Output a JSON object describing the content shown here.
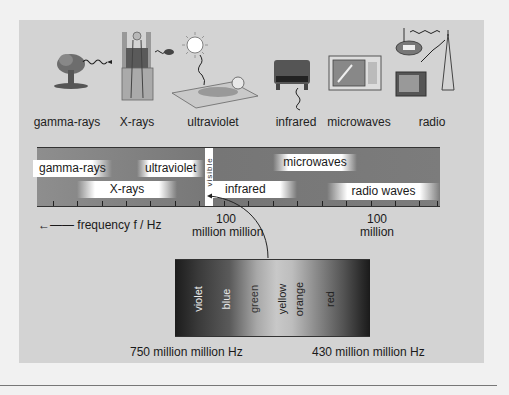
{
  "sources": [
    {
      "label": "gamma-rays",
      "icon": "mushroom-cloud-icon",
      "x": 67
    },
    {
      "label": "X-rays",
      "icon": "xray-scanner-icon",
      "x": 137
    },
    {
      "label": "ultraviolet",
      "icon": "sunbather-icon",
      "x": 213
    },
    {
      "label": "infrared",
      "icon": "electric-fire-icon",
      "x": 296
    },
    {
      "label": "microwaves",
      "icon": "microwave-oven-icon",
      "x": 359
    },
    {
      "label": "radio",
      "icon": "radio-tv-mast-icon",
      "x": 432
    }
  ],
  "band": {
    "regions": [
      {
        "label": "gamma-rays",
        "left": 0,
        "top": 12,
        "width": 58
      },
      {
        "label": "ultraviolet",
        "left": 108,
        "top": 12,
        "width": 60
      },
      {
        "label": "X-rays",
        "left": 45,
        "top": 32,
        "width": 100
      },
      {
        "label": "microwaves",
        "left": 242,
        "top": 6,
        "width": 80
      },
      {
        "label": "infrared",
        "left": 178,
        "top": 32,
        "width": 80
      },
      {
        "label": "radio waves",
        "left": 295,
        "top": 34,
        "width": 108
      }
    ],
    "visible_label": "visible",
    "ticks": [
      16,
      40,
      65,
      89,
      113,
      138,
      162,
      187,
      211,
      236,
      260,
      285,
      309,
      334,
      358,
      382,
      400
    ]
  },
  "axis": {
    "frequency_label": "frequency f / Hz",
    "arrow": "←——",
    "tick_label_1_line1": "100",
    "tick_label_1_line2": "million million",
    "tick_label_2_line1": "100",
    "tick_label_2_line2": "million"
  },
  "visible_spectrum": {
    "colors": [
      {
        "name": "violet",
        "x": 23
      },
      {
        "name": "blue",
        "x": 51
      },
      {
        "name": "green",
        "x": 79
      },
      {
        "name": "yellow",
        "x": 107
      },
      {
        "name": "orange",
        "x": 124
      },
      {
        "name": "red",
        "x": 155
      }
    ],
    "left_label": "750 million million Hz",
    "right_label": "430 million million Hz"
  }
}
